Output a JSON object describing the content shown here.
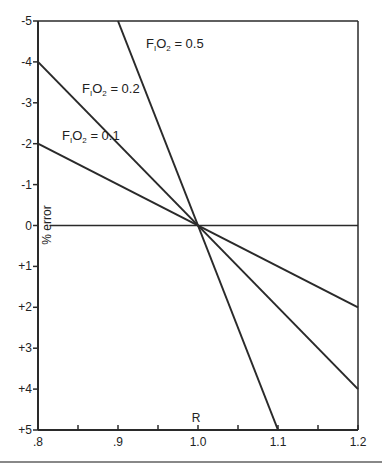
{
  "chart_data": {
    "type": "line",
    "title": "",
    "xlabel": "R",
    "ylabel": "% error",
    "xlim": [
      0.8,
      1.2
    ],
    "ylim": [
      -5,
      5
    ],
    "y_inverted": true,
    "grid": false,
    "x_ticks": [
      0.8,
      0.85,
      0.9,
      0.95,
      1.0,
      1.05,
      1.1,
      1.15,
      1.2
    ],
    "x_tick_labels": [
      {
        "value": 0.8,
        "label": ".8"
      },
      {
        "value": 0.9,
        "label": ".9"
      },
      {
        "value": 1.0,
        "label": "1.0"
      },
      {
        "value": 1.1,
        "label": "1.1"
      },
      {
        "value": 1.2,
        "label": "1.2"
      }
    ],
    "y_tick_labels": [
      {
        "value": -5,
        "label": "-5"
      },
      {
        "value": -4,
        "label": "-4"
      },
      {
        "value": -3,
        "label": "-3"
      },
      {
        "value": -2,
        "label": "-2"
      },
      {
        "value": -1,
        "label": "-1"
      },
      {
        "value": 0,
        "label": "0"
      },
      {
        "value": 1,
        "label": "+1"
      },
      {
        "value": 2,
        "label": "+2"
      },
      {
        "value": 3,
        "label": "+3"
      },
      {
        "value": 4,
        "label": "+4"
      },
      {
        "value": 5,
        "label": "+5"
      }
    ],
    "reference_line": {
      "y": 0
    },
    "series": [
      {
        "name": "FIO2 = 0.1",
        "label_main": "F",
        "label_sub1": "I",
        "label_mid": "O",
        "label_sub2": "2",
        "label_tail": " = 0.1",
        "x": [
          0.8,
          1.2
        ],
        "y": [
          -2,
          2
        ],
        "label_at": [
          0.83,
          -2.1
        ]
      },
      {
        "name": "FIO2 = 0.2",
        "label_main": "F",
        "label_sub1": "I",
        "label_mid": "O",
        "label_sub2": "2",
        "label_tail": " = 0.2",
        "x": [
          0.8,
          1.2
        ],
        "y": [
          -4,
          4
        ],
        "label_at": [
          0.855,
          -3.25
        ]
      },
      {
        "name": "FIO2 = 0.5",
        "label_main": "F",
        "label_sub1": "I",
        "label_mid": "O",
        "label_sub2": "2",
        "label_tail": " = 0.5",
        "x": [
          0.9,
          1.1
        ],
        "y": [
          -5,
          5
        ],
        "label_at": [
          0.935,
          -4.35
        ]
      }
    ]
  }
}
